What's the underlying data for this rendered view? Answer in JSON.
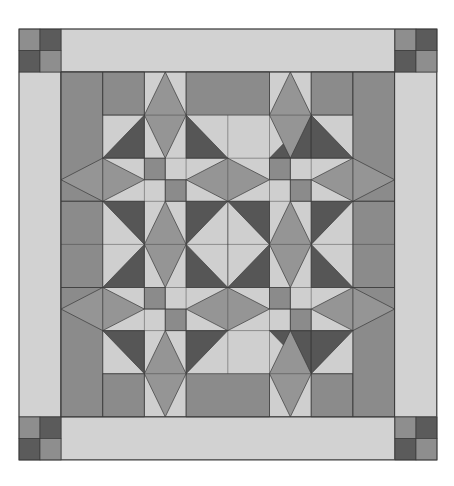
{
  "colors": {
    "background": "#ffffff",
    "light": "#cfcfcf",
    "border_light": "#d2d2d2",
    "medium": "#8b8b8b",
    "kite": "#959595",
    "dark": "#565656",
    "corner_dark": "#5b5b5b",
    "corner_medium": "#8e8e8e",
    "stroke": "#3a3a3a"
  },
  "geometry": {
    "outer": {
      "x": 19,
      "y": 29,
      "w": 418,
      "h": 431
    },
    "main": {
      "x": 61,
      "y": 72,
      "cols": 8,
      "rows": 8,
      "cell_w": 41.7,
      "cell_h": 43.1
    },
    "border": {
      "w": 42,
      "h": 43
    }
  },
  "corner_blocks": [
    {
      "name": "corner-top-left",
      "x": 19,
      "y": 29
    },
    {
      "name": "corner-top-right",
      "x": 395,
      "y": 29
    },
    {
      "name": "corner-bottom-left",
      "x": 19,
      "y": 417
    },
    {
      "name": "corner-bottom-right",
      "x": 395,
      "y": 417
    }
  ],
  "shapes": [
    {
      "c": "light",
      "p": [
        [
          0,
          0
        ],
        [
          8,
          0
        ],
        [
          8,
          8
        ],
        [
          0,
          8
        ]
      ]
    },
    {
      "c": "medium",
      "p": [
        [
          0,
          0
        ],
        [
          1,
          0
        ],
        [
          1,
          3
        ],
        [
          0,
          3
        ]
      ]
    },
    {
      "c": "medium",
      "p": [
        [
          1,
          0
        ],
        [
          2,
          0
        ],
        [
          2,
          1
        ],
        [
          1,
          1
        ]
      ]
    },
    {
      "c": "medium",
      "p": [
        [
          3,
          0
        ],
        [
          5,
          0
        ],
        [
          5,
          1
        ],
        [
          3,
          1
        ]
      ]
    },
    {
      "c": "medium",
      "p": [
        [
          6,
          0
        ],
        [
          7,
          0
        ],
        [
          7,
          1
        ],
        [
          6,
          1
        ]
      ]
    },
    {
      "c": "medium",
      "p": [
        [
          7,
          0
        ],
        [
          8,
          0
        ],
        [
          8,
          3
        ],
        [
          7,
          3
        ]
      ]
    },
    {
      "c": "medium",
      "p": [
        [
          0,
          3
        ],
        [
          1,
          3
        ],
        [
          1,
          5
        ],
        [
          0,
          5
        ]
      ]
    },
    {
      "c": "medium",
      "p": [
        [
          7,
          3
        ],
        [
          8,
          3
        ],
        [
          8,
          5
        ],
        [
          7,
          5
        ]
      ]
    },
    {
      "c": "medium",
      "p": [
        [
          0,
          5
        ],
        [
          1,
          5
        ],
        [
          1,
          8
        ],
        [
          0,
          8
        ]
      ]
    },
    {
      "c": "medium",
      "p": [
        [
          1,
          7
        ],
        [
          2,
          7
        ],
        [
          2,
          8
        ],
        [
          1,
          8
        ]
      ]
    },
    {
      "c": "medium",
      "p": [
        [
          3,
          7
        ],
        [
          5,
          7
        ],
        [
          5,
          8
        ],
        [
          3,
          8
        ]
      ]
    },
    {
      "c": "medium",
      "p": [
        [
          6,
          7
        ],
        [
          7,
          7
        ],
        [
          7,
          8
        ],
        [
          6,
          8
        ]
      ]
    },
    {
      "c": "medium",
      "p": [
        [
          7,
          5
        ],
        [
          8,
          5
        ],
        [
          8,
          8
        ],
        [
          7,
          8
        ]
      ]
    },
    {
      "c": "dark",
      "p": [
        [
          3,
          3
        ],
        [
          5,
          3
        ],
        [
          5,
          5
        ],
        [
          3,
          5
        ]
      ]
    },
    {
      "c": "light",
      "p": [
        [
          4,
          3
        ],
        [
          5,
          4
        ],
        [
          4,
          5
        ],
        [
          3,
          4
        ]
      ]
    },
    {
      "c": "dark",
      "p": [
        [
          2,
          1
        ],
        [
          2,
          2
        ],
        [
          1,
          2
        ]
      ]
    },
    {
      "c": "dark",
      "p": [
        [
          3,
          1
        ],
        [
          4,
          2
        ],
        [
          3,
          2
        ]
      ]
    },
    {
      "c": "dark",
      "p": [
        [
          6,
          1
        ],
        [
          6,
          2
        ],
        [
          5,
          2
        ]
      ]
    },
    {
      "c": "dark",
      "p": [
        [
          7,
          2
        ],
        [
          6,
          2
        ],
        [
          6,
          1
        ]
      ],
      "skip": true
    },
    {
      "c": "dark",
      "p": [
        [
          6,
          1
        ],
        [
          7,
          2
        ],
        [
          6,
          2
        ]
      ]
    },
    {
      "c": "dark",
      "p": [
        [
          1,
          3
        ],
        [
          2,
          3
        ],
        [
          2,
          4
        ]
      ]
    },
    {
      "c": "dark",
      "p": [
        [
          2,
          4
        ],
        [
          2,
          5
        ],
        [
          1,
          5
        ]
      ]
    },
    {
      "c": "dark",
      "p": [
        [
          6,
          3
        ],
        [
          7,
          3
        ],
        [
          6,
          4
        ]
      ]
    },
    {
      "c": "dark",
      "p": [
        [
          6,
          4
        ],
        [
          7,
          5
        ],
        [
          6,
          5
        ]
      ]
    },
    {
      "c": "dark",
      "p": [
        [
          1,
          6
        ],
        [
          2,
          6
        ],
        [
          2,
          7
        ]
      ]
    },
    {
      "c": "dark",
      "p": [
        [
          3,
          6
        ],
        [
          4,
          6
        ],
        [
          3,
          7
        ]
      ]
    },
    {
      "c": "dark",
      "p": [
        [
          5,
          6
        ],
        [
          6,
          6
        ],
        [
          6,
          7
        ]
      ]
    },
    {
      "c": "dark",
      "p": [
        [
          6,
          6
        ],
        [
          7,
          6
        ],
        [
          6,
          7
        ]
      ]
    },
    {
      "c": "medium",
      "p": [
        [
          2,
          2
        ],
        [
          2.5,
          2
        ],
        [
          2.5,
          2.5
        ],
        [
          2,
          2.5
        ]
      ]
    },
    {
      "c": "medium",
      "p": [
        [
          2.5,
          2.5
        ],
        [
          3,
          2.5
        ],
        [
          3,
          3
        ],
        [
          2.5,
          3
        ]
      ]
    },
    {
      "c": "medium",
      "p": [
        [
          5,
          2
        ],
        [
          5.5,
          2
        ],
        [
          5.5,
          2.5
        ],
        [
          5,
          2.5
        ]
      ]
    },
    {
      "c": "medium",
      "p": [
        [
          5.5,
          2.5
        ],
        [
          6,
          2.5
        ],
        [
          6,
          3
        ],
        [
          5.5,
          3
        ]
      ]
    },
    {
      "c": "medium",
      "p": [
        [
          2,
          5
        ],
        [
          2.5,
          5
        ],
        [
          2.5,
          5.5
        ],
        [
          2,
          5.5
        ]
      ]
    },
    {
      "c": "medium",
      "p": [
        [
          2.5,
          5.5
        ],
        [
          3,
          5.5
        ],
        [
          3,
          6
        ],
        [
          2.5,
          6
        ]
      ]
    },
    {
      "c": "medium",
      "p": [
        [
          5,
          5
        ],
        [
          5.5,
          5
        ],
        [
          5.5,
          5.5
        ],
        [
          5,
          5.5
        ]
      ]
    },
    {
      "c": "medium",
      "p": [
        [
          5.5,
          5.5
        ],
        [
          6,
          5.5
        ],
        [
          6,
          6
        ],
        [
          5.5,
          6
        ]
      ]
    },
    {
      "c": "kite",
      "p": [
        [
          2.5,
          0
        ],
        [
          3,
          1
        ],
        [
          2.5,
          2
        ],
        [
          2,
          1
        ]
      ]
    },
    {
      "c": "kite",
      "p": [
        [
          5.5,
          0
        ],
        [
          6,
          1
        ],
        [
          5.5,
          2
        ],
        [
          5,
          1
        ]
      ]
    },
    {
      "c": "kite",
      "p": [
        [
          2.5,
          3
        ],
        [
          3,
          4
        ],
        [
          2.5,
          5
        ],
        [
          2,
          4
        ]
      ]
    },
    {
      "c": "kite",
      "p": [
        [
          5.5,
          3
        ],
        [
          6,
          4
        ],
        [
          5.5,
          5
        ],
        [
          5,
          4
        ]
      ]
    },
    {
      "c": "kite",
      "p": [
        [
          2.5,
          6
        ],
        [
          3,
          7
        ],
        [
          2.5,
          8
        ],
        [
          2,
          7
        ]
      ]
    },
    {
      "c": "kite",
      "p": [
        [
          5.5,
          6
        ],
        [
          6,
          7
        ],
        [
          5.5,
          8
        ],
        [
          5,
          7
        ]
      ]
    },
    {
      "c": "kite",
      "p": [
        [
          0,
          2.5
        ],
        [
          1,
          2
        ],
        [
          2,
          2.5
        ],
        [
          1,
          3
        ]
      ]
    },
    {
      "c": "kite",
      "p": [
        [
          3,
          2.5
        ],
        [
          4,
          2
        ],
        [
          5,
          2.5
        ],
        [
          4,
          3
        ]
      ]
    },
    {
      "c": "kite",
      "p": [
        [
          6,
          2.5
        ],
        [
          7,
          2
        ],
        [
          8,
          2.5
        ],
        [
          7,
          3
        ]
      ]
    },
    {
      "c": "kite",
      "p": [
        [
          0,
          5.5
        ],
        [
          1,
          5
        ],
        [
          2,
          5.5
        ],
        [
          1,
          6
        ]
      ]
    },
    {
      "c": "kite",
      "p": [
        [
          3,
          5.5
        ],
        [
          4,
          5
        ],
        [
          5,
          5.5
        ],
        [
          4,
          6
        ]
      ]
    },
    {
      "c": "kite",
      "p": [
        [
          6,
          5.5
        ],
        [
          7,
          5
        ],
        [
          8,
          5.5
        ],
        [
          7,
          6
        ]
      ]
    }
  ],
  "lines": [
    [
      [
        1,
        0
      ],
      [
        1,
        8
      ]
    ],
    [
      [
        2,
        0
      ],
      [
        2,
        8
      ]
    ],
    [
      [
        3,
        0
      ],
      [
        3,
        8
      ]
    ],
    [
      [
        4,
        1
      ],
      [
        4,
        7
      ]
    ],
    [
      [
        5,
        0
      ],
      [
        5,
        8
      ]
    ],
    [
      [
        6,
        0
      ],
      [
        6,
        8
      ]
    ],
    [
      [
        7,
        0
      ],
      [
        7,
        8
      ]
    ],
    [
      [
        1,
        1
      ],
      [
        3,
        1
      ]
    ],
    [
      [
        5,
        1
      ],
      [
        7,
        1
      ]
    ],
    [
      [
        1,
        2
      ],
      [
        7,
        2
      ]
    ],
    [
      [
        0,
        3
      ],
      [
        8,
        3
      ]
    ],
    [
      [
        0,
        4
      ],
      [
        3,
        4
      ]
    ],
    [
      [
        5,
        4
      ],
      [
        8,
        4
      ]
    ],
    [
      [
        0,
        5
      ],
      [
        8,
        5
      ]
    ],
    [
      [
        1,
        6
      ],
      [
        7,
        6
      ]
    ],
    [
      [
        1,
        7
      ],
      [
        3,
        7
      ]
    ],
    [
      [
        5,
        7
      ],
      [
        7,
        7
      ]
    ],
    [
      [
        1,
        2
      ],
      [
        1,
        3
      ]
    ],
    [
      [
        1,
        5
      ],
      [
        1,
        6
      ]
    ],
    [
      [
        7,
        2
      ],
      [
        7,
        3
      ]
    ],
    [
      [
        7,
        5
      ],
      [
        7,
        6
      ]
    ],
    [
      [
        2,
        2.5
      ],
      [
        3,
        2.5
      ]
    ],
    [
      [
        2.5,
        2
      ],
      [
        2.5,
        3
      ]
    ],
    [
      [
        5,
        2.5
      ],
      [
        6,
        2.5
      ]
    ],
    [
      [
        5.5,
        2
      ],
      [
        5.5,
        3
      ]
    ],
    [
      [
        2,
        5.5
      ],
      [
        3,
        5.5
      ]
    ],
    [
      [
        2.5,
        5
      ],
      [
        2.5,
        6
      ]
    ],
    [
      [
        5,
        5.5
      ],
      [
        6,
        5.5
      ]
    ],
    [
      [
        5.5,
        5
      ],
      [
        5.5,
        6
      ]
    ],
    [
      [
        3,
        4
      ],
      [
        5,
        4
      ]
    ],
    [
      [
        4,
        3
      ],
      [
        4,
        5
      ]
    ]
  ]
}
